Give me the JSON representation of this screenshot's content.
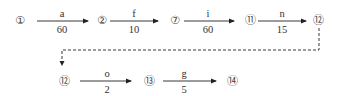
{
  "diagram": {
    "type": "activity-network",
    "nodes": [
      {
        "id": "n1",
        "label": "①",
        "x": 20,
        "y": 20
      },
      {
        "id": "n2",
        "label": "②",
        "x": 102,
        "y": 20
      },
      {
        "id": "n7",
        "label": "⑦",
        "x": 175,
        "y": 20
      },
      {
        "id": "n11",
        "label": "⑪",
        "x": 250,
        "y": 20
      },
      {
        "id": "n12a",
        "label": "⑫",
        "x": 318,
        "y": 20
      },
      {
        "id": "n12b",
        "label": "⑫",
        "x": 64,
        "y": 81
      },
      {
        "id": "n13",
        "label": "⑬",
        "x": 149,
        "y": 81
      },
      {
        "id": "n14",
        "label": "⑭",
        "x": 232,
        "y": 81
      }
    ],
    "edges": [
      {
        "from": "①",
        "to": "②",
        "activity": "a",
        "duration": "60"
      },
      {
        "from": "②",
        "to": "⑦",
        "activity": "f",
        "duration": "10"
      },
      {
        "from": "⑦",
        "to": "⑪",
        "activity": "i",
        "duration": "60"
      },
      {
        "from": "⑪",
        "to": "⑫",
        "activity": "n",
        "duration": "15"
      },
      {
        "from": "⑫",
        "to": "⑬",
        "activity": "o",
        "duration": "2"
      },
      {
        "from": "⑬",
        "to": "⑭",
        "activity": "g",
        "duration": "5"
      }
    ],
    "continuation": {
      "from": "⑫",
      "to": "⑫",
      "style": "dashed"
    }
  }
}
